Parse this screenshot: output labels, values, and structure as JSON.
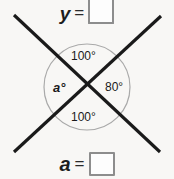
{
  "figure": {
    "type": "vertical-angles-diagram",
    "background_color": "#f8f7f5",
    "line_color": "#1a1a1a",
    "circle_color": "#a9a9a9",
    "box_border_color": "#8d8d8d",
    "circle": {
      "center_x": 87,
      "center_y": 87,
      "radius": 43
    },
    "lines": [
      {
        "name": "line-nw-se",
        "x1": 14,
        "y1": 15,
        "x2": 160,
        "y2": 152
      },
      {
        "name": "line-ne-sw",
        "x1": 161,
        "y1": 16,
        "x2": 14,
        "y2": 152
      }
    ],
    "angles": {
      "top": "100°",
      "right": "80°",
      "left": "a°",
      "bottom": "100°"
    }
  },
  "equations": {
    "top": {
      "variable": "y",
      "operator": "=",
      "answer_value": "",
      "answer_placeholder": ""
    },
    "bottom": {
      "variable": "a",
      "operator": "=",
      "answer_value": "",
      "answer_placeholder": ""
    }
  }
}
